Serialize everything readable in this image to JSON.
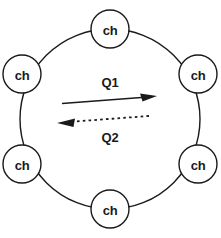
{
  "diagram": {
    "background_color": "#ffffff",
    "stroke_color": "#1a1a1a",
    "ring": {
      "name": "ring-circle",
      "center_x": 110,
      "center_y": 119,
      "radius": 90
    },
    "nodes": [
      {
        "id": "node-top",
        "label": "ch",
        "cx": 110,
        "cy": 29,
        "r": 19
      },
      {
        "id": "node-right-upper",
        "label": "ch",
        "cx": 198,
        "cy": 74,
        "r": 19
      },
      {
        "id": "node-right-lower",
        "label": "ch",
        "cx": 198,
        "cy": 164,
        "r": 19
      },
      {
        "id": "node-bottom",
        "label": "ch",
        "cx": 110,
        "cy": 209,
        "r": 19
      },
      {
        "id": "node-left-lower",
        "label": "ch",
        "cx": 22,
        "cy": 164,
        "r": 19
      },
      {
        "id": "node-left-upper",
        "label": "ch",
        "cx": 22,
        "cy": 74,
        "r": 19
      }
    ],
    "flows": [
      {
        "id": "flow-q1",
        "label": "Q1",
        "style": "solid",
        "direction": "right",
        "label_x": 110,
        "label_y": 82,
        "x1": 62,
        "y1": 103,
        "x2": 156,
        "y2": 96
      },
      {
        "id": "flow-q2",
        "label": "Q2",
        "style": "dashed",
        "direction": "left",
        "label_x": 110,
        "label_y": 137,
        "x1": 149,
        "y1": 116,
        "x2": 58,
        "y2": 123
      }
    ]
  }
}
